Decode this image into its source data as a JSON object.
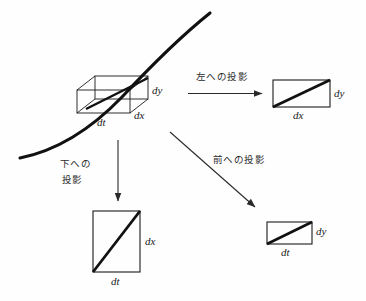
{
  "figure": {
    "background_color": "#fefefe",
    "ink_color": "#1a1a1a",
    "curve_color": "#111111"
  },
  "cell3d": {
    "name": "differential-volume-box",
    "labels": {
      "dy": "dy",
      "dx": "dx",
      "dt": "dt"
    }
  },
  "curve": {
    "name": "world-line-curve",
    "description": "thick curve passing diagonally through the 3D box"
  },
  "arrows": {
    "left": {
      "label": "左への投影",
      "direction": "right"
    },
    "down": {
      "label_line1": "下への",
      "label_line2": "投影",
      "direction": "down"
    },
    "front": {
      "label": "前への投影",
      "direction": "down-right"
    }
  },
  "projections": {
    "left_panel": {
      "name": "projection-left",
      "side_label": "dy",
      "bottom_label": "dx"
    },
    "down_panel": {
      "name": "projection-down",
      "side_label": "dx",
      "bottom_label": "dt"
    },
    "front_panel": {
      "name": "projection-front",
      "side_label": "dy",
      "bottom_label": "dt"
    }
  }
}
